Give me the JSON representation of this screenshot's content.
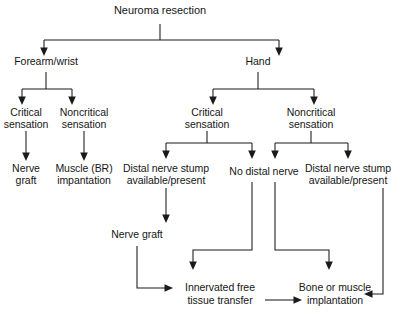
{
  "diagram": {
    "title": "Neuroma resection",
    "type": "flowchart",
    "orientation": "top-down",
    "background_color": "#ffffff",
    "line_color": "#1a1a1a",
    "text_color": "#161616",
    "nodes": [
      {
        "id": "root",
        "label": "Neuroma resection",
        "lines": [
          "Neuroma resection"
        ],
        "x": 160,
        "y": 10,
        "level": 0
      },
      {
        "id": "forearm",
        "label": "Forearm/wrist",
        "lines": [
          "Forearm/wrist"
        ],
        "x": 46,
        "y": 62,
        "level": 1
      },
      {
        "id": "hand",
        "label": "Hand",
        "lines": [
          "Hand"
        ],
        "x": 258,
        "y": 62,
        "level": 1
      },
      {
        "id": "fw-critical",
        "label": "Critical sensation",
        "lines": [
          "Critical",
          "sensation"
        ],
        "x": 26,
        "y": 118,
        "level": 2
      },
      {
        "id": "fw-noncritical",
        "label": "Noncritical sensation",
        "lines": [
          "Noncritical",
          "sensation"
        ],
        "x": 84,
        "y": 118,
        "level": 2
      },
      {
        "id": "hand-critical",
        "label": "Critical sensation",
        "lines": [
          "Critical",
          "sensation"
        ],
        "x": 207,
        "y": 118,
        "level": 2
      },
      {
        "id": "hand-noncrit",
        "label": "Noncritical sensation",
        "lines": [
          "Noncritical",
          "sensation"
        ],
        "x": 311,
        "y": 118,
        "level": 2
      },
      {
        "id": "nerve-graft-1",
        "label": "Nerve graft",
        "lines": [
          "Nerve",
          "graft"
        ],
        "x": 26,
        "y": 174,
        "level": 3
      },
      {
        "id": "muscle-br",
        "label": "Muscle (BR) impantation",
        "lines": [
          "Muscle (BR)",
          "impantation"
        ],
        "x": 84,
        "y": 174,
        "level": 3
      },
      {
        "id": "stump-left",
        "label": "Distal nerve stump available/present",
        "lines": [
          "Distal nerve stump",
          "available/present"
        ],
        "x": 166,
        "y": 174,
        "level": 3
      },
      {
        "id": "no-distal",
        "label": "No distal nerve",
        "lines": [
          "No distal nerve"
        ],
        "x": 264,
        "y": 172,
        "level": 3
      },
      {
        "id": "stump-right",
        "label": "Distal nerve stump available/present",
        "lines": [
          "Distal nerve stump",
          "available/present"
        ],
        "x": 348,
        "y": 174,
        "level": 3
      },
      {
        "id": "nerve-graft-2",
        "label": "Nerve graft",
        "lines": [
          "Nerve graft"
        ],
        "x": 137,
        "y": 235,
        "level": 4
      },
      {
        "id": "innervated",
        "label": "Innervated free tissue transfer",
        "lines": [
          "Innervated free",
          "tissue transfer"
        ],
        "x": 225,
        "y": 291,
        "level": 5
      },
      {
        "id": "bone-muscle",
        "label": "Bone or muscle implantation",
        "lines": [
          "Bone or muscle",
          "implantation"
        ],
        "x": 335,
        "y": 291,
        "level": 5
      }
    ],
    "edges": [
      {
        "from": "root",
        "to": "forearm",
        "style": "elbow-down"
      },
      {
        "from": "root",
        "to": "hand",
        "style": "elbow-down"
      },
      {
        "from": "forearm",
        "to": "fw-critical",
        "style": "elbow-down"
      },
      {
        "from": "forearm",
        "to": "fw-noncritical",
        "style": "elbow-down"
      },
      {
        "from": "hand",
        "to": "hand-critical",
        "style": "elbow-down"
      },
      {
        "from": "hand",
        "to": "hand-noncrit",
        "style": "elbow-down"
      },
      {
        "from": "fw-critical",
        "to": "nerve-graft-1",
        "style": "straight-down"
      },
      {
        "from": "fw-noncritical",
        "to": "muscle-br",
        "style": "straight-down"
      },
      {
        "from": "hand-critical",
        "to": "stump-left",
        "style": "elbow-down"
      },
      {
        "from": "hand-critical",
        "to": "no-distal",
        "style": "elbow-down"
      },
      {
        "from": "hand-noncrit",
        "to": "no-distal",
        "style": "elbow-down"
      },
      {
        "from": "hand-noncrit",
        "to": "stump-right",
        "style": "elbow-down"
      },
      {
        "from": "stump-left",
        "to": "nerve-graft-2",
        "style": "straight-down"
      },
      {
        "from": "nerve-graft-2",
        "to": "innervated",
        "style": "elbow-right"
      },
      {
        "from": "no-distal",
        "to": "innervated",
        "style": "elbow-left"
      },
      {
        "from": "no-distal",
        "to": "bone-muscle",
        "style": "elbow-right"
      },
      {
        "from": "stump-right",
        "to": "bone-muscle",
        "style": "elbow-left"
      },
      {
        "from": "innervated",
        "to": "bone-muscle",
        "style": "horizontal"
      }
    ]
  }
}
